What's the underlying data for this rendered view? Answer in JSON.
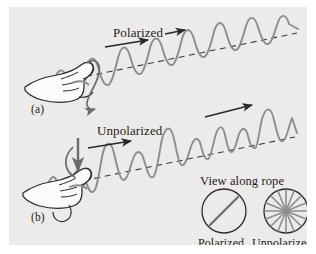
{
  "figure": {
    "background_color": "#ecebe9",
    "page_color": "#ffffff",
    "ink_color": "#1d1b19",
    "wave_color": "#8c8c8c"
  },
  "panels": [
    {
      "id": "a",
      "label": "(a)",
      "caption": "Polarized",
      "wave_type": "polarized",
      "description": "hand shaking rope up and down in one plane producing regular transverse wave"
    },
    {
      "id": "b",
      "label": "(b)",
      "caption": "Unpolarized",
      "wave_type": "unpolarized",
      "description": "hand shaking rope in random directions producing irregular wave"
    }
  ],
  "labels": {
    "polarized_a": "Polarized",
    "unpolarized_b": "Unpolarized",
    "panel_a": "(a)",
    "panel_b": "(b)",
    "view_along_rope": "View along rope",
    "circle_polarized": "Polarized",
    "circle_unpolarized": "Unpolarized"
  },
  "cross_sections": [
    {
      "name": "polarized",
      "label": "Polarized",
      "pattern": "single-diagonal-line",
      "spokes": 1
    },
    {
      "name": "unpolarized",
      "label": "Unpolarized",
      "pattern": "radial-starburst",
      "spokes": 16
    }
  ],
  "arrows": [
    {
      "name": "propagation-arrow-a",
      "panel": "a",
      "direction": "right",
      "meaning": "wave travel direction"
    },
    {
      "name": "propagation-arrow-b",
      "panel": "b",
      "direction": "right",
      "meaning": "wave travel direction"
    },
    {
      "name": "propagation-arrow-b-upper",
      "panel": "b",
      "direction": "up-right",
      "meaning": "wave travel direction"
    },
    {
      "name": "hand-motion-arrow-a",
      "panel": "a",
      "direction": "vertical-loop",
      "meaning": "hand oscillates in one plane"
    },
    {
      "name": "hand-motion-arrow-b",
      "panel": "b",
      "direction": "down",
      "meaning": "hand oscillates randomly"
    }
  ]
}
